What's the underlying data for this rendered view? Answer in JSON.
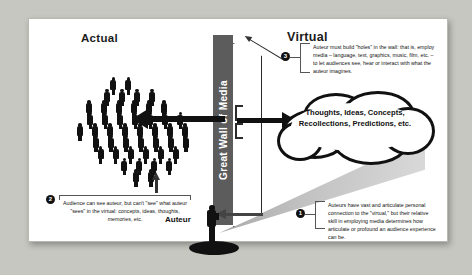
{
  "diagram": {
    "headings": {
      "actual": "Actual",
      "virtual": "Virtual"
    },
    "wall_label": "Great Wall of Media",
    "auteur_label": "Auteur",
    "cloud_text": "Thoughts, Ideas, Concepts, Recollections, Predictions, etc.",
    "callouts": [
      {
        "number": "1",
        "text": "Auteurs have vast and articulate personal connection to the \"virtual,\" but their relative skill in employing media determines how articulate or profound an audience experience can be."
      },
      {
        "number": "2",
        "text": "Audience can see auteur, but can't \"see\" what auteur \"sees\" in the virtual: concepts, ideas, thoughts, memories, etc."
      },
      {
        "number": "3",
        "text": "Auteur must build \"holes\" in the wall: that is, employ media – language, text, graphics, music, film, etc. – to let audiences see, hear or interact with what the auteur imagines."
      }
    ],
    "colors": {
      "wall": "#5c5c5c",
      "ink": "#111111",
      "panel": "#ffffff",
      "mat": "#c7c7c2"
    }
  }
}
